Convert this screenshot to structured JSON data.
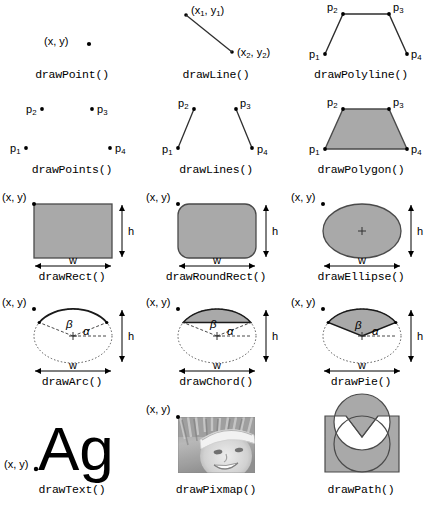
{
  "figure": {
    "background": "#ffffff",
    "fill_color": "#a9a9a9",
    "stroke_color": "#444444",
    "text_color": "#000000"
  },
  "labels": {
    "xy": "(x, y)",
    "x1": "x",
    "x1_sub": "1",
    "y1": "y",
    "y1_sub": "1",
    "x2": "x",
    "x2_sub": "2",
    "y2": "y",
    "y2_sub": "2",
    "p": "p",
    "p1_sub": "1",
    "p2_sub": "2",
    "p3_sub": "3",
    "p4_sub": "4",
    "w": "w",
    "h": "h",
    "alpha": "α",
    "beta": "β",
    "paren_open": "(",
    "paren_close": ")",
    "comma": ",",
    "sample_text": "Ag"
  },
  "cells": [
    {
      "id": "draw-point",
      "caption": "drawPoint()",
      "row": 0,
      "col": 0
    },
    {
      "id": "draw-line",
      "caption": "drawLine()",
      "row": 0,
      "col": 1
    },
    {
      "id": "draw-polyline",
      "caption": "drawPolyline()",
      "row": 0,
      "col": 2
    },
    {
      "id": "draw-points",
      "caption": "drawPoints()",
      "row": 1,
      "col": 0
    },
    {
      "id": "draw-lines",
      "caption": "drawLines()",
      "row": 1,
      "col": 1
    },
    {
      "id": "draw-polygon",
      "caption": "drawPolygon()",
      "row": 1,
      "col": 2
    },
    {
      "id": "draw-rect",
      "caption": "drawRect()",
      "row": 2,
      "col": 0
    },
    {
      "id": "draw-roundrect",
      "caption": "drawRoundRect()",
      "row": 2,
      "col": 1
    },
    {
      "id": "draw-ellipse",
      "caption": "drawEllipse()",
      "row": 2,
      "col": 2
    },
    {
      "id": "draw-arc",
      "caption": "drawArc()",
      "row": 3,
      "col": 0
    },
    {
      "id": "draw-chord",
      "caption": "drawChord()",
      "row": 3,
      "col": 1
    },
    {
      "id": "draw-pie",
      "caption": "drawPie()",
      "row": 3,
      "col": 2
    },
    {
      "id": "draw-text",
      "caption": "drawText()",
      "row": 4,
      "col": 0
    },
    {
      "id": "draw-pixmap",
      "caption": "drawPixmap()",
      "row": 4,
      "col": 1
    },
    {
      "id": "draw-path",
      "caption": "drawPath()",
      "row": 4,
      "col": 2
    }
  ],
  "pixmap": {
    "description": "grayscale photograph of a smiling person wearing a white cap"
  }
}
